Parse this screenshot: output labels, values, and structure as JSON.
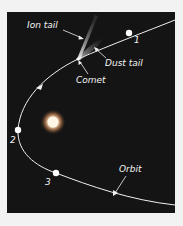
{
  "diagram": {
    "colors": {
      "background": "#141414",
      "page": "#f2f2f2",
      "line": "#f0f0f0",
      "sun_core": "#fff4e0",
      "sun_glow": "#e8a060"
    },
    "labels": {
      "ion_tail": "Ion tail",
      "dust_tail": "Dust tail",
      "comet": "Comet",
      "orbit": "Orbit"
    },
    "positions": [
      {
        "id": "1",
        "label": "1"
      },
      {
        "id": "2",
        "label": "2"
      },
      {
        "id": "3",
        "label": "3"
      }
    ],
    "bodies": {
      "sun": "sun",
      "comet": "comet"
    }
  }
}
